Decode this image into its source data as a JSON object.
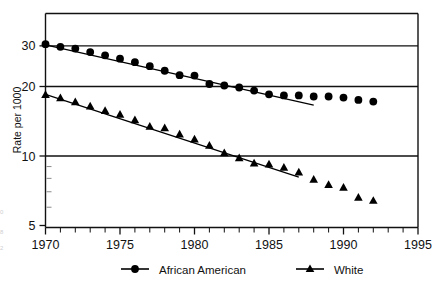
{
  "chart_data": {
    "type": "line",
    "title": "",
    "xlabel": "",
    "ylabel": "Rate per 1000",
    "yscale": "log",
    "xlim": [
      1970,
      1995
    ],
    "ylim": [
      5,
      34
    ],
    "xticks": [
      1970,
      1975,
      1980,
      1985,
      1990,
      1995
    ],
    "xtick_labels": [
      "1970",
      "1975",
      "1980",
      "1985",
      "1990",
      "1995"
    ],
    "x_minor_tick_interval": 1,
    "yticks": [
      5,
      10,
      20,
      30
    ],
    "ytick_labels": [
      "5",
      "10",
      "20",
      "30"
    ],
    "gridlines": [
      10,
      20,
      30
    ],
    "grid": "horizontal-major-only",
    "legend_position": "below-axes",
    "series": [
      {
        "name": "African American",
        "marker": "circle",
        "color": "#000000",
        "x": [
          1970,
          1971,
          1972,
          1973,
          1974,
          1975,
          1976,
          1977,
          1978,
          1979,
          1980,
          1981,
          1982,
          1983,
          1984,
          1985,
          1986,
          1987,
          1988,
          1989,
          1990,
          1991,
          1992
        ],
        "values": [
          30.5,
          29.7,
          29.2,
          28.2,
          27.3,
          26.4,
          25.5,
          24.5,
          23.4,
          22.4,
          22.3,
          20.5,
          20.2,
          19.8,
          19.2,
          18.5,
          18.3,
          18.3,
          18.1,
          18.1,
          17.9,
          17.5,
          17.2
        ],
        "trend_line": {
          "x_start": 1970,
          "x_end": 1988,
          "y_start": 30.3,
          "y_end": 16.6
        }
      },
      {
        "name": "White",
        "marker": "triangle",
        "color": "#000000",
        "x": [
          1970,
          1971,
          1972,
          1973,
          1974,
          1975,
          1976,
          1977,
          1978,
          1979,
          1980,
          1981,
          1982,
          1983,
          1984,
          1985,
          1986,
          1987,
          1988,
          1989,
          1990,
          1991,
          1992
        ],
        "values": [
          18.4,
          17.8,
          17.1,
          16.4,
          15.7,
          15.1,
          14.3,
          13.4,
          13.2,
          12.4,
          11.8,
          11.1,
          10.3,
          9.8,
          9.3,
          9.2,
          8.9,
          8.5,
          7.9,
          7.5,
          7.3,
          6.6,
          6.4
        ],
        "trend_line": {
          "x_start": 1970,
          "x_end": 1987,
          "y_start": 18.5,
          "y_end": 8.1
        }
      }
    ]
  },
  "legend": {
    "items": [
      {
        "label": "African American",
        "marker": "circle"
      },
      {
        "label": "White",
        "marker": "triangle"
      }
    ]
  },
  "margin_notes": [
    "0",
    "8",
    "2"
  ]
}
